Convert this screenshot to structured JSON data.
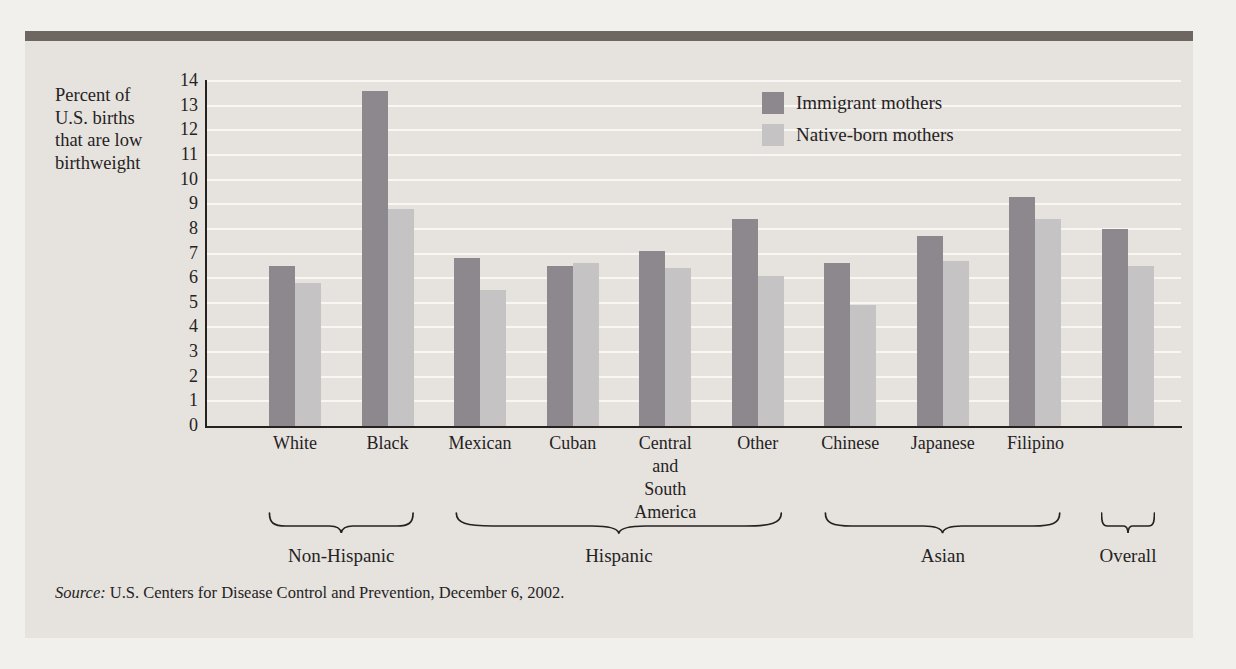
{
  "figure": {
    "y_axis_label_lines": [
      "Percent of",
      "U.S. births",
      "that are low",
      "birthweight"
    ],
    "source_prefix": "Source:",
    "source_text": " U.S. Centers for Disease Control and Prevention, December 6, 2002."
  },
  "chart_data": {
    "type": "bar",
    "title": "",
    "ylabel": "Percent of U.S. births that are low birthweight",
    "ylim": [
      0,
      14
    ],
    "ytick_interval": 1,
    "grid": true,
    "legend_position": "top-right-inside",
    "categories": [
      "White",
      "Black",
      "Mexican",
      "Cuban",
      "Central and South America",
      "Other",
      "Chinese",
      "Japanese",
      "Filipino",
      "Overall"
    ],
    "category_label_lines": [
      [
        "White"
      ],
      [
        "Black"
      ],
      [
        "Mexican"
      ],
      [
        "Cuban"
      ],
      [
        "Central",
        "and",
        "South",
        "America"
      ],
      [
        "Other"
      ],
      [
        "Chinese"
      ],
      [
        "Japanese"
      ],
      [
        "Filipino"
      ],
      []
    ],
    "series": [
      {
        "name": "Immigrant mothers",
        "color": "#8c888d",
        "values": [
          6.5,
          13.6,
          6.8,
          6.5,
          7.1,
          8.4,
          6.6,
          7.7,
          9.3,
          8.0
        ]
      },
      {
        "name": "Native-born mothers",
        "color": "#c5c3c4",
        "values": [
          5.8,
          8.8,
          5.5,
          6.6,
          6.4,
          6.1,
          4.9,
          6.7,
          8.4,
          6.5
        ]
      }
    ],
    "groups": [
      {
        "label": "Non-Hispanic",
        "span": [
          0,
          1
        ]
      },
      {
        "label": "Hispanic",
        "span": [
          2,
          5
        ]
      },
      {
        "label": "Asian",
        "span": [
          6,
          8
        ]
      },
      {
        "label": "Overall",
        "span": [
          9,
          9
        ]
      }
    ]
  },
  "colors": {
    "panel_background": "#e6e3de",
    "page_background": "#f2f0ec",
    "top_rule": "#6e6661",
    "gridline": "#f8f7f4",
    "ink": "#25221f",
    "immigrant_bar": "#8c888d",
    "native_bar": "#c5c3c4"
  }
}
